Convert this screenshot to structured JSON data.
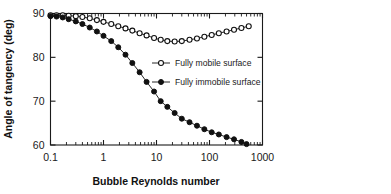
{
  "chart_data": {
    "type": "line",
    "title": "",
    "xlabel": "Bubble Reynolds number",
    "ylabel": "Angle of tangency (deg)",
    "xscale": "log",
    "yscale": "linear",
    "xlim": [
      0.1,
      1000
    ],
    "ylim": [
      60,
      90
    ],
    "xticks": [
      0.1,
      1,
      10,
      100,
      1000
    ],
    "xtick_labels": [
      "0.1",
      "1",
      "10",
      "100",
      "1000"
    ],
    "yticks": [
      60,
      70,
      80,
      90
    ],
    "ytick_labels": [
      "60",
      "70",
      "80",
      "90"
    ],
    "grid": false,
    "legend_position": "center-right-inside",
    "series": [
      {
        "name": "Fully mobile surface",
        "marker": "open-circle",
        "color": "#111111",
        "x": [
          0.1,
          0.13,
          0.17,
          0.22,
          0.3,
          0.4,
          0.55,
          0.75,
          1.0,
          1.4,
          1.9,
          2.6,
          3.5,
          4.8,
          6.5,
          9.0,
          12,
          16,
          22,
          30,
          42,
          58,
          80,
          110,
          150,
          210,
          290,
          400,
          550
        ],
        "y": [
          89.6,
          89.6,
          89.6,
          89.5,
          89.4,
          89.2,
          88.9,
          88.5,
          88.1,
          87.6,
          87.1,
          86.6,
          86.1,
          85.5,
          85.0,
          84.4,
          84.0,
          83.7,
          83.6,
          83.7,
          84.0,
          84.3,
          84.7,
          85.1,
          85.5,
          85.9,
          86.3,
          86.7,
          87.1
        ]
      },
      {
        "name": "Fully immobile surface",
        "marker": "filled-circle",
        "color": "#111111",
        "x": [
          0.1,
          0.13,
          0.17,
          0.22,
          0.3,
          0.4,
          0.55,
          0.75,
          1.0,
          1.4,
          1.9,
          2.6,
          3.5,
          4.8,
          6.5,
          9.0,
          12,
          16,
          22,
          30,
          42,
          58,
          80,
          110,
          150,
          210,
          290,
          400,
          500
        ],
        "y": [
          89.4,
          89.3,
          89.1,
          88.7,
          88.2,
          87.6,
          86.8,
          85.9,
          84.9,
          83.7,
          82.3,
          80.6,
          78.7,
          76.6,
          74.4,
          72.2,
          70.0,
          68.7,
          67.3,
          66.0,
          65.2,
          64.4,
          63.6,
          62.9,
          62.4,
          61.8,
          61.3,
          60.7,
          60.2
        ]
      }
    ],
    "legend_entries": [
      {
        "label": "Fully mobile surface",
        "marker": "open-circle"
      },
      {
        "label": "Fully immobile surface",
        "marker": "filled-circle"
      }
    ]
  }
}
